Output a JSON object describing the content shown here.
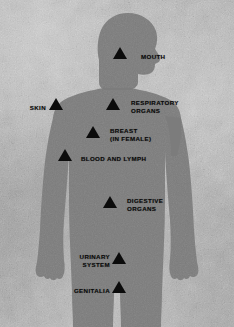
{
  "diagram": {
    "colors": {
      "background": "#b6b6b6",
      "body": "#7c7c7c",
      "marker": "#0b0b0b",
      "label_text": "#090909"
    },
    "marker_icon": "triangle-up-icon",
    "figure_name": "human-body-silhouette",
    "markers": [
      {
        "id": "mouth",
        "label": "MOUTH",
        "align": "right",
        "marker": {
          "x": 120,
          "y": 47
        },
        "label_pos": {
          "x": 141,
          "y": 53
        }
      },
      {
        "id": "skin",
        "label": "SKIN",
        "align": "left",
        "marker": {
          "x": 56,
          "y": 98
        },
        "label_pos": {
          "x": 28,
          "y": 104
        }
      },
      {
        "id": "respiratory-organs",
        "label": "RESPIRATORY\nORGANS",
        "align": "right",
        "marker": {
          "x": 113,
          "y": 98
        },
        "label_pos": {
          "x": 131,
          "y": 99
        }
      },
      {
        "id": "breast-in-female",
        "label": "BREAST\n(IN FEMALE)",
        "align": "right",
        "marker": {
          "x": 93,
          "y": 126
        },
        "label_pos": {
          "x": 110,
          "y": 127
        }
      },
      {
        "id": "blood-and-lymph",
        "label": "BLOOD AND LYMPH",
        "align": "right",
        "marker": {
          "x": 65,
          "y": 149
        },
        "label_pos": {
          "x": 81,
          "y": 155
        }
      },
      {
        "id": "digestive-organs",
        "label": "DIGESTIVE\nORGANS",
        "align": "right",
        "marker": {
          "x": 110,
          "y": 196
        },
        "label_pos": {
          "x": 127,
          "y": 197
        }
      },
      {
        "id": "urinary-system",
        "label": "URINARY\nSYSTEM",
        "align": "left",
        "marker": {
          "x": 112,
          "y": 252
        },
        "label_pos_right": {
          "x": 131,
          "y": 253
        },
        "label_pos": {
          "x": 106,
          "y": 253
        }
      },
      {
        "id": "genitalia",
        "label": "GENITALIA",
        "align": "left",
        "marker": {
          "x": 112,
          "y": 281
        },
        "label_pos": {
          "x": 106,
          "y": 287
        }
      }
    ]
  }
}
